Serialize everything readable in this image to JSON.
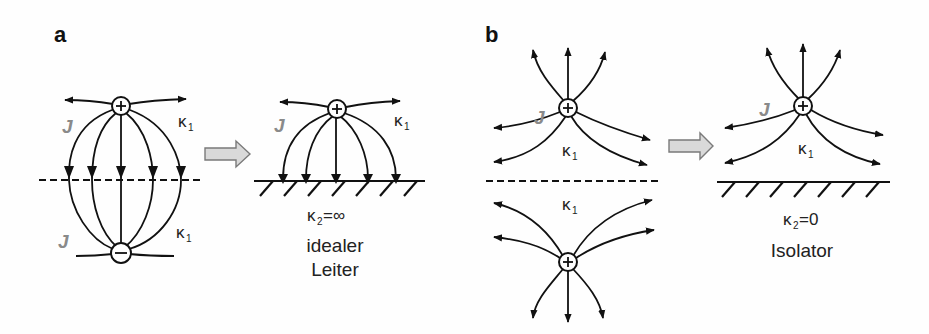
{
  "figure": {
    "panel_a": {
      "label": "a",
      "left": {
        "top_charge": "+",
        "bottom_charge": "−",
        "current_label_top": "J",
        "current_label_bottom": "J",
        "conductivity_top": "κ",
        "conductivity_top_sub": "1",
        "conductivity_bottom": "κ",
        "conductivity_bottom_sub": "1"
      },
      "arrow": "transition-arrow",
      "right": {
        "charge": "+",
        "current_label": "J",
        "conductivity": "κ",
        "conductivity_sub": "1",
        "boundary_conductivity": "κ",
        "boundary_conductivity_sub": "2",
        "boundary_value": "=∞",
        "caption_line1": "idealer",
        "caption_line2": "Leiter"
      }
    },
    "panel_b": {
      "label": "b",
      "left": {
        "top_charge": "+",
        "bottom_charge": "+",
        "current_label": "J",
        "conductivity_top": "κ",
        "conductivity_top_sub": "1",
        "conductivity_bottom": "κ",
        "conductivity_bottom_sub": "1"
      },
      "arrow": "transition-arrow",
      "right": {
        "charge": "+",
        "current_label": "J",
        "conductivity": "κ",
        "conductivity_sub": "1",
        "boundary_conductivity": "κ",
        "boundary_conductivity_sub": "2",
        "boundary_value": "=0",
        "caption": "Isolator"
      }
    },
    "colors": {
      "lines": "#111111",
      "current_label": "#8a8a8a",
      "transition_arrow_fill": "#d9d9d9",
      "transition_arrow_stroke": "#7a7a7a"
    }
  }
}
